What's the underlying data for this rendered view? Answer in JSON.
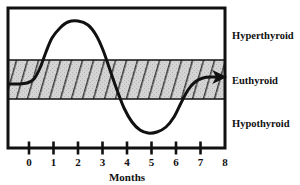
{
  "chart_data": {
    "type": "line",
    "title": "",
    "xlabel": "Months",
    "ylabel": "",
    "xlim": [
      -0.85,
      8.0
    ],
    "ylim": [
      0,
      1
    ],
    "grid": false,
    "legend_position": "right",
    "x_ticks": [
      0,
      1,
      2,
      3,
      4,
      5,
      6,
      7,
      8
    ],
    "x_tick_labels": [
      "0",
      "1",
      "2",
      "3",
      "4",
      "5",
      "6",
      "7",
      "8"
    ],
    "bands": [
      {
        "name": "Hyperthyroid",
        "label": "Hyperthyroid",
        "fill": "none",
        "y_range_px": [
          8,
          60
        ]
      },
      {
        "name": "Euthyroid",
        "label": "Euthyroid",
        "fill": "#d4d4d4",
        "hatch": "diagonal",
        "y_range_px": [
          60,
          99
        ]
      },
      {
        "name": "Hypothyroid",
        "label": "Hypothyroid",
        "fill": "none",
        "y_range_px": [
          99,
          148
        ]
      }
    ],
    "series": [
      {
        "name": "thyroid-status-curve",
        "color": "#111111",
        "line_width": 3,
        "arrow_end": true,
        "points_px": [
          [
            9,
            84
          ],
          [
            18,
            84
          ],
          [
            27,
            83
          ],
          [
            34,
            79
          ],
          [
            40,
            68
          ],
          [
            46,
            52
          ],
          [
            52,
            38
          ],
          [
            60,
            28
          ],
          [
            68,
            22
          ],
          [
            78,
            21
          ],
          [
            88,
            25
          ],
          [
            96,
            35
          ],
          [
            103,
            50
          ],
          [
            110,
            70
          ],
          [
            117,
            90
          ],
          [
            124,
            108
          ],
          [
            132,
            122
          ],
          [
            140,
            130
          ],
          [
            148,
            133
          ],
          [
            157,
            132
          ],
          [
            166,
            127
          ],
          [
            174,
            117
          ],
          [
            181,
            103
          ],
          [
            188,
            90
          ],
          [
            195,
            82
          ],
          [
            203,
            78
          ],
          [
            212,
            77
          ],
          [
            222,
            77
          ]
        ],
        "points_months": [
          [
            -0.82,
            0.5
          ],
          [
            -0.45,
            0.5
          ],
          [
            -0.09,
            0.51
          ],
          [
            0.2,
            0.54
          ],
          [
            0.45,
            0.62
          ],
          [
            0.69,
            0.73
          ],
          [
            0.94,
            0.83
          ],
          [
            1.27,
            0.9
          ],
          [
            1.59,
            0.94
          ],
          [
            2.0,
            0.95
          ],
          [
            2.41,
            0.92
          ],
          [
            2.73,
            0.85
          ],
          [
            3.02,
            0.75
          ],
          [
            3.31,
            0.61
          ],
          [
            3.59,
            0.47
          ],
          [
            3.88,
            0.34
          ],
          [
            4.2,
            0.24
          ],
          [
            4.53,
            0.19
          ],
          [
            4.86,
            0.17
          ],
          [
            5.22,
            0.17
          ],
          [
            5.59,
            0.21
          ],
          [
            5.92,
            0.28
          ],
          [
            6.2,
            0.38
          ],
          [
            6.49,
            0.47
          ],
          [
            6.78,
            0.52
          ],
          [
            7.1,
            0.55
          ],
          [
            7.47,
            0.56
          ],
          [
            7.88,
            0.56
          ]
        ]
      }
    ],
    "annotations": [
      {
        "name": "curve-arrowhead",
        "shape": "arrow",
        "x_px": 222,
        "y_px": 77
      }
    ],
    "frame": {
      "left_px": 8,
      "right_px": 225,
      "top_px": 8,
      "bottom_px": 148,
      "border_color": "#111111",
      "border_width": 3
    }
  },
  "axis": {
    "x_title": "Months",
    "tick_labels": [
      "0",
      "1",
      "2",
      "3",
      "4",
      "5",
      "6",
      "7",
      "8"
    ]
  },
  "zones": {
    "hyperthyroid": "Hyperthyroid",
    "euthyroid": "Euthyroid",
    "hypothyroid": "Hypothyroid"
  },
  "colors": {
    "ink": "#111111",
    "band_fill": "#d4d4d4",
    "hatch_stroke": "#333333",
    "background": "#ffffff"
  }
}
